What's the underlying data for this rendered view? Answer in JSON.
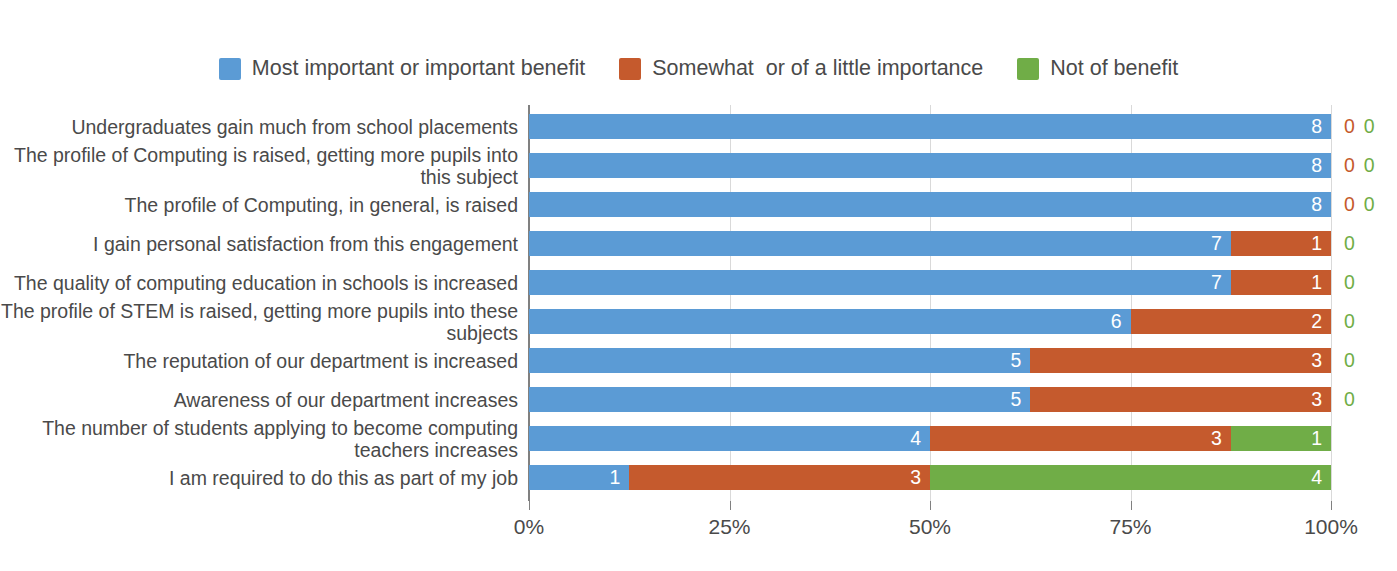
{
  "chart_data": {
    "type": "bar",
    "subtype": "stacked-horizontal-100pct",
    "title": "",
    "xlabel": "",
    "ylabel": "",
    "grid": true,
    "legend_position": "top-center",
    "xlim": [
      0,
      100
    ],
    "xtick_labels": [
      "0%",
      "25%",
      "50%",
      "75%",
      "100%"
    ],
    "xtick_values": [
      0,
      25,
      50,
      75,
      100
    ],
    "total_responses": 8,
    "series": [
      {
        "name": "Most important or important benefit",
        "color": "#5B9BD5",
        "values": [
          8,
          8,
          8,
          7,
          7,
          6,
          5,
          5,
          4,
          1
        ]
      },
      {
        "name": "Somewhat  or of a little importance",
        "color": "#C55A2D",
        "values": [
          0,
          0,
          0,
          1,
          1,
          2,
          3,
          3,
          3,
          3
        ]
      },
      {
        "name": "Not of benefit",
        "color": "#70AD47",
        "values": [
          0,
          0,
          0,
          0,
          0,
          0,
          0,
          0,
          1,
          4
        ]
      }
    ],
    "categories": [
      "Undergraduates gain much from school placements",
      "The profile of Computing is raised, getting more pupils into this subject",
      "The profile of Computing, in general, is raised",
      "I gain personal satisfaction from this engagement",
      "The quality of computing education in schools is increased",
      "The profile of STEM is raised, getting more pupils into these subjects",
      "The reputation of our department is increased",
      "Awareness of our department increases",
      "The number of students applying to become computing teachers increases",
      "I am required to do this as part of my job"
    ]
  },
  "legend": {
    "items": [
      {
        "label": "Most important or important benefit",
        "color": "#5B9BD5"
      },
      {
        "label": "Somewhat  or of a little importance",
        "color": "#C55A2D"
      },
      {
        "label": "Not of benefit",
        "color": "#70AD47"
      }
    ]
  },
  "colors": {
    "blue": "#5B9BD5",
    "orange": "#C55A2D",
    "green": "#70AD47",
    "gridline": "#d9d9d9",
    "axis": "#808080",
    "text": "#4a4a4a"
  }
}
